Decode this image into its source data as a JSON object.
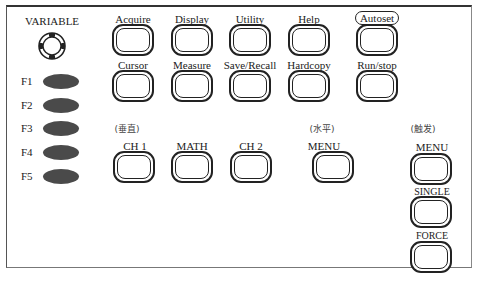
{
  "panel": {
    "variable": {
      "label": "VARIABLE",
      "icon": "rotary-knob-icon"
    },
    "function_keys": [
      {
        "label": "F1"
      },
      {
        "label": "F2"
      },
      {
        "label": "F3"
      },
      {
        "label": "F4"
      },
      {
        "label": "F5"
      }
    ],
    "menu_row1": [
      {
        "label": "Acquire"
      },
      {
        "label": "Display"
      },
      {
        "label": "Utility"
      },
      {
        "label": "Help"
      },
      {
        "label": "Autoset"
      }
    ],
    "menu_row2": [
      {
        "label": "Cursor"
      },
      {
        "label": "Measure"
      },
      {
        "label": "Save/Recall"
      },
      {
        "label": "Hardcopy"
      },
      {
        "label": "Run/stop"
      }
    ],
    "sections": {
      "vertical": {
        "title": "(垂直)",
        "buttons": [
          {
            "label": "CH 1"
          },
          {
            "label": "MATH"
          },
          {
            "label": "CH 2"
          }
        ]
      },
      "horizontal": {
        "title": "(水平)",
        "buttons": [
          {
            "label": "MENU"
          }
        ]
      },
      "trigger": {
        "title": "(触发)",
        "buttons": [
          {
            "label": "MENU"
          },
          {
            "label": "SINGLE"
          },
          {
            "label": "FORCE"
          }
        ]
      }
    }
  }
}
